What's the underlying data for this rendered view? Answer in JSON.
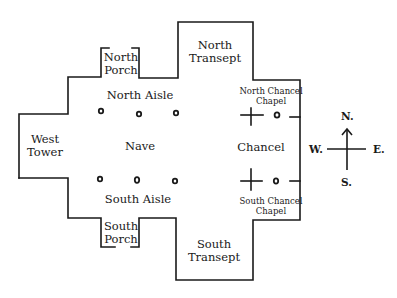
{
  "diagram": {
    "type": "church floor plan",
    "rooms": {
      "north_porch": [
        "North",
        "Porch"
      ],
      "north_aisle": "North Aisle",
      "north_transept": [
        "North",
        "Transept"
      ],
      "north_chancel_chapel": [
        "North Chancel",
        "Chapel"
      ],
      "west_tower": [
        "West",
        "Tower"
      ],
      "nave": "Nave",
      "chancel": "Chancel",
      "south_aisle": "South Aisle",
      "south_porch": [
        "South",
        "Porch"
      ],
      "south_transept": [
        "South",
        "Transept"
      ],
      "south_chancel_chapel": [
        "South Chancel",
        "Chapel"
      ]
    },
    "compass": {
      "north": "N.",
      "south": "S.",
      "east": "E.",
      "west": "W."
    },
    "line_color": "#1a1a1a",
    "background": "#ffffff"
  }
}
